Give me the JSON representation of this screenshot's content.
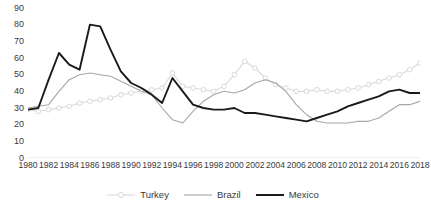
{
  "chart_data": {
    "type": "line",
    "title": "",
    "subtitle": "",
    "xlabel": "",
    "ylabel": "",
    "xlim": [
      1980,
      2018
    ],
    "ylim": [
      0,
      90
    ],
    "y_ticks": [
      0,
      10,
      20,
      30,
      40,
      50,
      60,
      70,
      80,
      90
    ],
    "x_ticks": [
      1980,
      1982,
      1984,
      1986,
      1988,
      1990,
      1992,
      1994,
      1996,
      1998,
      2000,
      2002,
      2004,
      2006,
      2008,
      2010,
      2012,
      2014,
      2016,
      2018
    ],
    "x": [
      1980,
      1981,
      1982,
      1983,
      1984,
      1985,
      1986,
      1987,
      1988,
      1989,
      1990,
      1991,
      1992,
      1993,
      1994,
      1995,
      1996,
      1997,
      1998,
      1999,
      2000,
      2001,
      2002,
      2003,
      2004,
      2005,
      2006,
      2007,
      2008,
      2009,
      2010,
      2011,
      2012,
      2013,
      2014,
      2015,
      2016,
      2017,
      2018
    ],
    "grid": false,
    "legend_position": "bottom",
    "series": [
      {
        "name": "Turkey",
        "color": "#d9d9d9",
        "marker": "circle",
        "values": [
          29,
          28,
          29,
          30,
          31,
          33,
          34,
          35,
          36,
          38,
          39,
          40,
          41,
          42,
          51,
          43,
          42,
          41,
          40,
          43,
          50,
          58,
          54,
          48,
          44,
          42,
          40,
          40,
          41,
          40,
          40,
          41,
          42,
          44,
          46,
          48,
          50,
          53,
          57
        ]
      },
      {
        "name": "Brazil",
        "color": "#a6a6a6",
        "marker": "none",
        "values": [
          30,
          31,
          32,
          40,
          47,
          50,
          51,
          50,
          49,
          46,
          43,
          40,
          38,
          30,
          23,
          21,
          28,
          34,
          38,
          40,
          39,
          41,
          45,
          47,
          45,
          40,
          32,
          26,
          22,
          21,
          21,
          21,
          22,
          22,
          24,
          28,
          32,
          32,
          34
        ]
      },
      {
        "name": "Mexico",
        "color": "#1a1a1a",
        "marker": "none",
        "values": [
          29,
          30,
          47,
          63,
          56,
          53,
          80,
          79,
          65,
          52,
          45,
          42,
          38,
          33,
          48,
          40,
          32,
          30,
          29,
          29,
          30,
          27,
          27,
          26,
          25,
          24,
          23,
          22,
          24,
          26,
          28,
          31,
          33,
          35,
          37,
          40,
          41,
          39,
          39
        ]
      }
    ]
  },
  "legend": {
    "items": [
      {
        "label": "Turkey"
      },
      {
        "label": "Brazil"
      },
      {
        "label": "Mexico"
      }
    ]
  }
}
